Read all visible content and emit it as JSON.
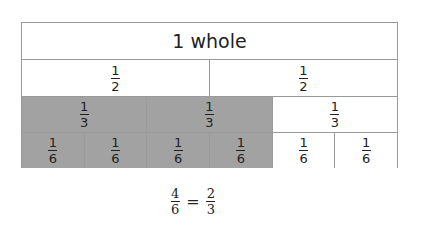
{
  "diagram": {
    "colors": {
      "shaded": "#a2a2a2",
      "unshaded": "#ffffff",
      "border": "#9a9a9a"
    },
    "rows": [
      {
        "cells": [
          {
            "label": "1 whole",
            "shaded": false
          }
        ]
      },
      {
        "cells": [
          {
            "num": "1",
            "den": "2",
            "shaded": false
          },
          {
            "num": "1",
            "den": "2",
            "shaded": false
          }
        ]
      },
      {
        "cells": [
          {
            "num": "1",
            "den": "3",
            "shaded": true
          },
          {
            "num": "1",
            "den": "3",
            "shaded": true
          },
          {
            "num": "1",
            "den": "3",
            "shaded": false
          }
        ]
      },
      {
        "cells": [
          {
            "num": "1",
            "den": "6",
            "shaded": true
          },
          {
            "num": "1",
            "den": "6",
            "shaded": true
          },
          {
            "num": "1",
            "den": "6",
            "shaded": true
          },
          {
            "num": "1",
            "den": "6",
            "shaded": true
          },
          {
            "num": "1",
            "den": "6",
            "shaded": false
          },
          {
            "num": "1",
            "den": "6",
            "shaded": false
          }
        ]
      }
    ],
    "equation": {
      "left": {
        "num": "4",
        "den": "6"
      },
      "sign": "=",
      "right": {
        "num": "2",
        "den": "3"
      }
    }
  }
}
